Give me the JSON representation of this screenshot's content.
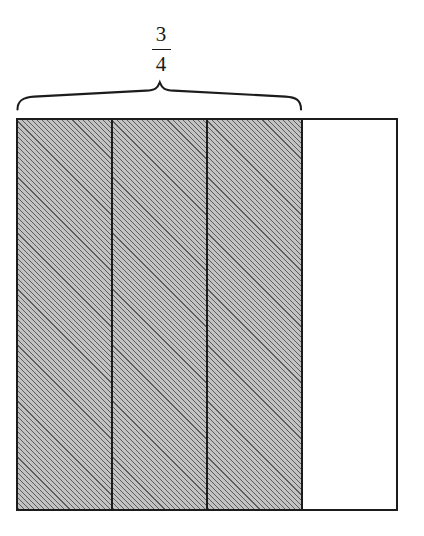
{
  "figure": {
    "type": "fraction-bar-model",
    "title": "",
    "fraction": {
      "numerator": "3",
      "denominator": "4",
      "display": "3/4"
    },
    "bar": {
      "total_parts": 4,
      "shaded_parts": 3,
      "unshaded_parts": 1,
      "cells": [
        {
          "index": "1",
          "shaded": "true",
          "fill": "hatched-gray"
        },
        {
          "index": "2",
          "shaded": "true",
          "fill": "hatched-gray"
        },
        {
          "index": "3",
          "shaded": "true",
          "fill": "hatched-gray"
        },
        {
          "index": "4",
          "shaded": "false",
          "fill": "white"
        }
      ]
    },
    "brace": {
      "label": "3/4",
      "spans_parts": "3",
      "direction": "up",
      "icon": "curly-brace-up-icon"
    },
    "colors": {
      "outline": "#1c1c1c",
      "shaded_fill": "#a8a8a8",
      "hatch_line": "#1e1e1e",
      "background": "#ffffff",
      "text": "#1a1a1a"
    }
  }
}
